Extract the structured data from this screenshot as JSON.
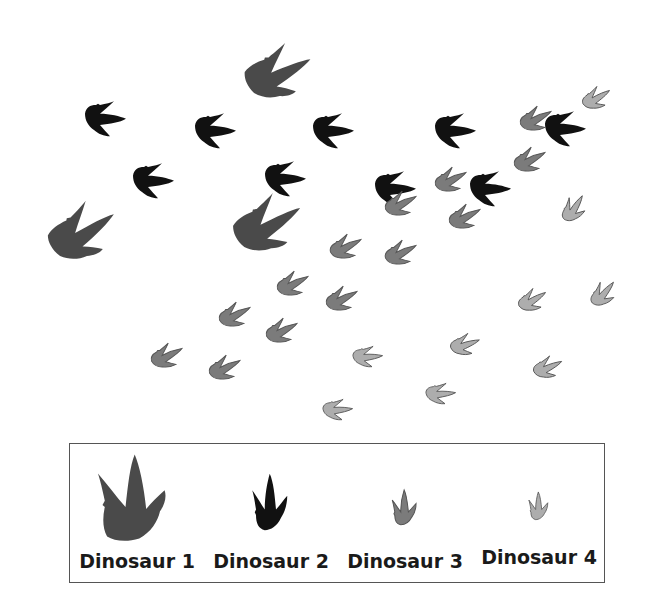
{
  "figure": {
    "colors": {
      "dinosaur_1": "#4a4a4a",
      "dinosaur_2": "#111111",
      "dinosaur_3": "#7b7b7b",
      "dinosaur_4": "#adadad"
    }
  },
  "legend": {
    "items": [
      {
        "label": "Dinosaur 1",
        "icon": "large-dark-gray-footprint-icon"
      },
      {
        "label": "Dinosaur 2",
        "icon": "black-footprint-icon"
      },
      {
        "label": "Dinosaur 3",
        "icon": "medium-gray-footprint-icon"
      },
      {
        "label": "Dinosaur 4",
        "icon": "light-gray-footprint-icon"
      }
    ]
  },
  "tracks": {
    "dinosaur_1": [
      [
        275,
        80
      ],
      [
        80,
        240
      ],
      [
        265,
        232
      ]
    ],
    "dinosaur_2": [
      [
        100,
        120
      ],
      [
        210,
        132
      ],
      [
        328,
        132
      ],
      [
        450,
        132
      ],
      [
        560,
        130
      ],
      [
        148,
        182
      ],
      [
        280,
        180
      ],
      [
        390,
        190
      ],
      [
        485,
        190
      ]
    ],
    "dinosaur_3": [
      [
        533,
        122
      ],
      [
        448,
        183
      ],
      [
        398,
        207
      ],
      [
        527,
        163
      ],
      [
        462,
        220
      ],
      [
        343,
        250
      ],
      [
        398,
        256
      ],
      [
        290,
        287
      ],
      [
        339,
        302
      ],
      [
        232,
        318
      ],
      [
        279,
        334
      ],
      [
        164,
        359
      ],
      [
        222,
        371
      ]
    ],
    "dinosaur_4": [
      [
        594,
        101
      ],
      [
        573,
        212
      ],
      [
        530,
        303
      ],
      [
        602,
        297
      ],
      [
        364,
        358
      ],
      [
        462,
        347
      ],
      [
        545,
        370
      ],
      [
        334,
        411
      ],
      [
        437,
        395
      ]
    ]
  }
}
